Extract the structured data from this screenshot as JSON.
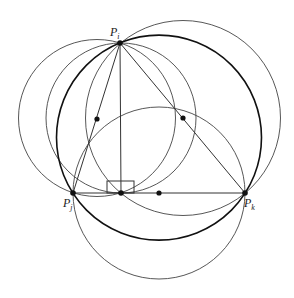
{
  "diagram": {
    "title": "",
    "points": [
      {
        "id": "Pi",
        "label": "P",
        "sub": "i",
        "x": 120,
        "y": 43
      },
      {
        "id": "Pj",
        "label": "P",
        "sub": "j",
        "x": 73,
        "y": 193
      },
      {
        "id": "Pk",
        "label": "P",
        "sub": "k",
        "x": 245,
        "y": 193
      },
      {
        "id": "H",
        "label": "",
        "x": 121,
        "y": 193
      }
    ],
    "centers": [
      {
        "x": 97,
        "y": 119
      },
      {
        "x": 183,
        "y": 118
      },
      {
        "x": 159,
        "y": 193
      }
    ],
    "colors": {
      "stroke": "#333333",
      "thick": "#111111",
      "point": "#111111"
    }
  }
}
